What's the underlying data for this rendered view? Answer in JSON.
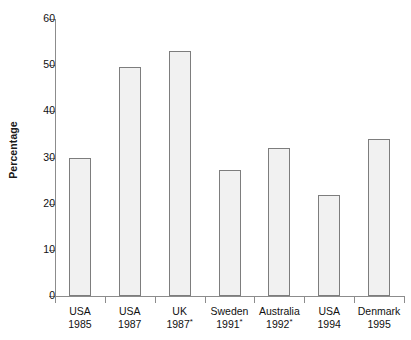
{
  "chart_data": {
    "type": "bar",
    "title": "",
    "subtitle": "",
    "xlabel": "",
    "ylabel": "Percentage",
    "ylim": [
      0,
      60
    ],
    "ytick_values": [
      0,
      10,
      20,
      30,
      40,
      50,
      60
    ],
    "ytick_labels": [
      "0",
      "10",
      "20",
      "30",
      "40",
      "50",
      "60"
    ],
    "grid": false,
    "legend": null,
    "bar_style": {
      "fill": "#f1f1f1",
      "edge": "#7d7d7d"
    },
    "axis_color": "#8c8c8c",
    "categories": [
      "USA 1985",
      "USA 1987",
      "UK 1987*",
      "Sweden 1991*",
      "Australia 1992*",
      "USA 1994",
      "Denmark 1995"
    ],
    "values": [
      30.0,
      49.7,
      53.0,
      27.3,
      32.0,
      21.9,
      34.0
    ],
    "category_labels": [
      {
        "name": "USA",
        "year": "1985",
        "footnote": ""
      },
      {
        "name": "USA",
        "year": "1987",
        "footnote": ""
      },
      {
        "name": "UK",
        "year": "1987",
        "footnote": "*"
      },
      {
        "name": "Sweden",
        "year": "1991",
        "footnote": "*"
      },
      {
        "name": "Australia",
        "year": "1992",
        "footnote": "*"
      },
      {
        "name": "USA",
        "year": "1994",
        "footnote": ""
      },
      {
        "name": "Denmark",
        "year": "1995",
        "footnote": ""
      }
    ]
  }
}
